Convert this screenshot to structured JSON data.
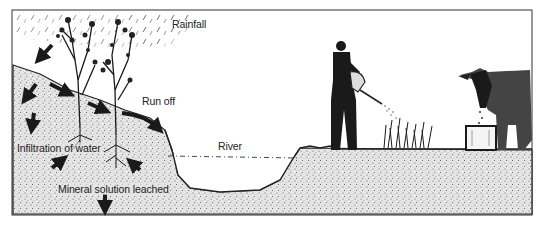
{
  "diagram": {
    "labels": {
      "rainfall": "Rainfall",
      "run_off": "Run off",
      "infiltration": "Infiltration of water",
      "river": "River",
      "mineral": "Mineral solution leached"
    },
    "elements": [
      {
        "name": "rain",
        "description": "diagonal rain streaks in top-left sky"
      },
      {
        "name": "hillside",
        "description": "stippled soil slope on left descending to river"
      },
      {
        "name": "trees",
        "description": "two tall shrubs/trees with roots on hillside"
      },
      {
        "name": "river-channel",
        "description": "U-shaped river channel with dashed water line"
      },
      {
        "name": "farmer",
        "description": "man watering crops with a watering can"
      },
      {
        "name": "crops",
        "description": "small cluster of plants being watered"
      },
      {
        "name": "cow",
        "description": "cow drinking from a water trough"
      },
      {
        "name": "trough",
        "description": "rectangular water trough"
      }
    ],
    "colors": {
      "ink": "#1a1a1a",
      "soil": "#d9d9d9",
      "background": "#ffffff"
    }
  }
}
